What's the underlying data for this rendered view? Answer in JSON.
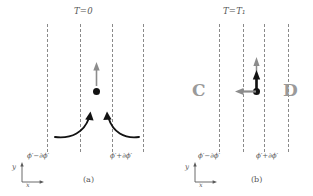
{
  "figure": {
    "caption_a": "(a)",
    "caption_b": "(b)"
  },
  "panel_a": {
    "title": "T=0",
    "label_left": "ϕ′−∂ϕ′",
    "label_right": "ϕ′+∂ϕ′",
    "axis_y": "y",
    "axis_x": "x",
    "caption": "(a)",
    "dashed_lines_x": [
      47,
      80,
      112,
      143
    ],
    "particle": {
      "x": 100,
      "y": 92
    },
    "velocity_arrow": "up-gray",
    "flow_arrows": [
      "curved-arrow-left",
      "curved-arrow-right"
    ]
  },
  "panel_b": {
    "title": "T=T₁",
    "label_left": "ϕ′−∂ϕ′",
    "label_right": "ϕ′+∂ϕ′",
    "axis_y": "y",
    "axis_x": "x",
    "caption": "(b)",
    "region_left": "C",
    "region_right": "D",
    "dashed_lines_x": [
      219,
      243,
      264,
      288
    ],
    "particle": {
      "x": 256,
      "y": 91
    },
    "arrows": [
      "up-black-short",
      "up-gray-long",
      "left-gray"
    ]
  },
  "colors": {
    "dash": "#8a8a8a",
    "ink": "#121212",
    "gray_arrow": "#8c8c8c",
    "big_letter": "#9a9a9a",
    "text": "#555555",
    "background": "#ffffff"
  }
}
